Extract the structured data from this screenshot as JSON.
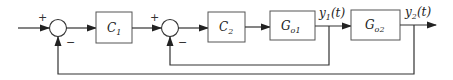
{
  "diagram": {
    "type": "cascade-control-block-diagram",
    "blocks": [
      {
        "id": "C1",
        "label": "C",
        "sub": "1"
      },
      {
        "id": "C2",
        "label": "C",
        "sub": "2"
      },
      {
        "id": "Go1",
        "label": "G",
        "sub": "o1"
      },
      {
        "id": "Go2",
        "label": "G",
        "sub": "o2"
      }
    ],
    "summing_junctions": [
      {
        "id": "sum1",
        "plus": "+",
        "minus": "−"
      },
      {
        "id": "sum2",
        "plus": "+",
        "minus": "−"
      }
    ],
    "signals": {
      "y1": {
        "label": "y",
        "sub": "1",
        "arg": "(t)"
      },
      "y2": {
        "label": "y",
        "sub": "2",
        "arg": "(t)"
      }
    },
    "colors": {
      "line": "#333333",
      "box": "#555555"
    }
  }
}
